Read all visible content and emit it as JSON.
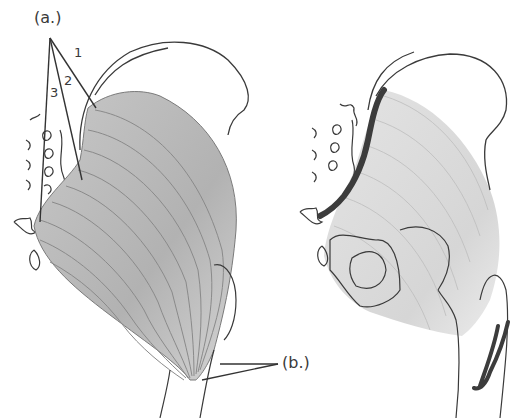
{
  "figure": {
    "colors": {
      "outline": "#3a3a3a",
      "muscle_fill": "#b8b8b8",
      "muscle_fill_light": "#d9d9d9",
      "fiber_line": "#8a8a8a",
      "attachment": "#3c3c3c",
      "background": "#ffffff"
    },
    "left_panel": {
      "title": "muscle fibers view",
      "label_a": "(a.)",
      "label_b": "(b.)",
      "numbers": [
        "1",
        "2",
        "3"
      ]
    },
    "right_panel": {
      "title": "origin and insertion view",
      "marks": [
        "origin-along-sacrum-ilium",
        "insertion-at-femur"
      ]
    }
  }
}
